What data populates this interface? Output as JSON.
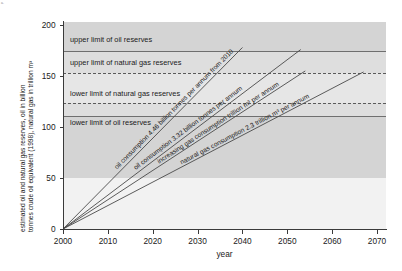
{
  "corner_mark": "a.",
  "chart_data": {
    "type": "line",
    "title": "",
    "xlabel": "year",
    "ylabel": "estimated oil and natural gas reserves, oil in billion tonnes crude oil equivalent (1998), natural gas in trillion m³",
    "ylabel_line1": "estimated oil and natural gas reserves, oil in billion",
    "ylabel_line2": "tonnes crude oil equivalent (1998), natural gas in trillion m³",
    "xlim": [
      2000,
      2072
    ],
    "ylim": [
      0,
      203
    ],
    "xticks": [
      2000,
      2010,
      2020,
      2030,
      2040,
      2050,
      2060,
      2070
    ],
    "xticklabels": [
      "2000",
      "2010",
      "2020",
      "2030",
      "2040",
      "2050",
      "2060",
      "2070"
    ],
    "yticks": [
      0,
      50,
      100,
      150,
      200
    ],
    "yticklabels": [
      "0",
      "50",
      "100",
      "150",
      "200"
    ],
    "grid": false,
    "legend_position": "inline-annotations",
    "reference_lines": [
      {
        "label": "upper limit of oil reserves",
        "value": 175,
        "style": "solid",
        "label_y": 186
      },
      {
        "label": "upper limit of natural gas reserves",
        "value": 153,
        "style": "dash-dot",
        "label_y": 163
      },
      {
        "label": "lower limit of natural gas reserves",
        "value": 124,
        "style": "dash-dot",
        "label_y": 133
      },
      {
        "label": "lower limit of oil reserves",
        "value": 111,
        "style": "solid",
        "label_y": 104
      }
    ],
    "shaded_bands": [
      {
        "from": 175,
        "to": 203,
        "shade": "dark"
      },
      {
        "from": 153,
        "to": 175,
        "shade": "mid"
      },
      {
        "from": 124,
        "to": 153,
        "shade": "light"
      },
      {
        "from": 111,
        "to": 124,
        "shade": "mid"
      },
      {
        "from": 50,
        "to": 111,
        "shade": "dark"
      },
      {
        "from": 0,
        "to": 50,
        "shade": "lightest"
      }
    ],
    "series": [
      {
        "name": "oil consumption 4.46 billion tonnes per annum from 2010",
        "rate_per_year": 4.46,
        "x": [
          2000,
          2040
        ],
        "values": [
          0,
          178
        ],
        "label_at_x": 2013
      },
      {
        "name": "oil consumption 3.32 billion tonnes per annum",
        "rate_per_year": 3.32,
        "x": [
          2000,
          2053
        ],
        "values": [
          0,
          176
        ],
        "label_at_x": 2017
      },
      {
        "name": "increasing gas consumption trillion m³ per annum",
        "rate_per_year": 2.87,
        "x": [
          2000,
          2054
        ],
        "values": [
          0,
          155
        ],
        "label_at_x": 2022
      },
      {
        "name": "natural gas consumption 2.3 trillion m³ per annum",
        "rate_per_year": 2.3,
        "x": [
          2000,
          2067
        ],
        "values": [
          0,
          154
        ],
        "label_at_x": 2027
      }
    ],
    "colors": {
      "line": "#4a4a4a",
      "reference_line": "#6f6f6f",
      "band_dark": "#d4d4d4",
      "band_mid": "#dedede",
      "band_light": "#e6e6e6",
      "band_lightest": "#f2f2f2",
      "axis": "#3a3a3a",
      "text": "#1a1a1a"
    }
  }
}
